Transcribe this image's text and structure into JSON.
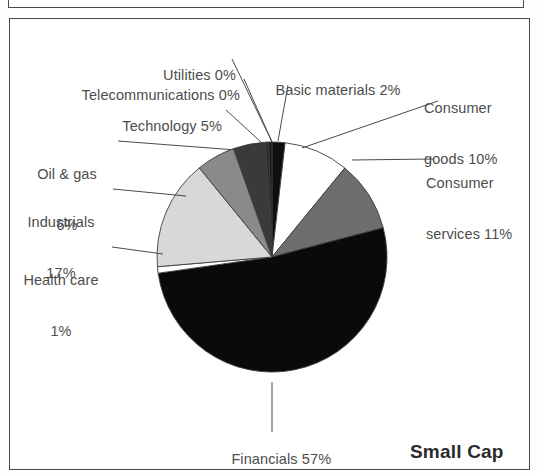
{
  "panel": {
    "title": "Small Cap",
    "border_color": "#4a4a4a",
    "background": "#ffffff"
  },
  "chart_data": {
    "type": "pie",
    "title": "Small Cap",
    "total": 109,
    "units": "percent",
    "legend": "none (direct labels with leader lines)",
    "start_angle_deg": 0,
    "direction": "clockwise",
    "categories": [
      "Basic materials",
      "Consumer goods",
      "Consumer services",
      "Financials",
      "Health care",
      "Industrials",
      "Oil & gas",
      "Technology",
      "Telecommunications",
      "Utilities"
    ],
    "values": [
      2,
      10,
      11,
      57,
      1,
      17,
      6,
      5,
      0,
      0
    ],
    "colors": [
      "#0e0e0e",
      "#ffffff",
      "#6e6e6e",
      "#0a0a0a",
      "#ffffff",
      "#d8d8d8",
      "#8a8a8a",
      "#3a3a3a",
      "#2a2a2a",
      "#1a1a1a"
    ],
    "slices": [
      {
        "label": "Basic materials",
        "value": 2,
        "label_text": "Basic materials 2%",
        "color": "#0e0e0e"
      },
      {
        "label": "Consumer goods",
        "value": 10,
        "label_text": "Consumer goods 10%",
        "color": "#ffffff"
      },
      {
        "label": "Consumer services",
        "value": 11,
        "label_text": "Consumer services 11%",
        "color": "#6e6e6e"
      },
      {
        "label": "Financials",
        "value": 57,
        "label_text": "Financials 57%",
        "color": "#0a0a0a"
      },
      {
        "label": "Health care",
        "value": 1,
        "label_text": "Health care 1%",
        "color": "#ffffff"
      },
      {
        "label": "Industrials",
        "value": 17,
        "label_text": "Industrials 17%",
        "color": "#d8d8d8"
      },
      {
        "label": "Oil & gas",
        "value": 6,
        "label_text": "Oil & gas 6%",
        "color": "#8a8a8a"
      },
      {
        "label": "Technology",
        "value": 5,
        "label_text": "Technology 5%",
        "color": "#3a3a3a"
      },
      {
        "label": "Telecommunications",
        "value": 0,
        "label_text": "Telecommunications 0%",
        "color": "#2a2a2a"
      },
      {
        "label": "Utilities",
        "value": 0,
        "label_text": "Utilities 0%",
        "color": "#1a1a1a"
      }
    ]
  },
  "labels": {
    "utilities": {
      "line1": "Utilities 0%"
    },
    "telecommunications": {
      "line1": "Telecommunications 0%"
    },
    "technology": {
      "line1": "Technology 5%"
    },
    "oil_gas": {
      "line1": "Oil & gas",
      "line2": "6%"
    },
    "industrials": {
      "line1": "Industrials",
      "line2": "17%"
    },
    "health_care": {
      "line1": "Health care",
      "line2": "1%"
    },
    "basic_materials": {
      "line1": "Basic materials 2%"
    },
    "consumer_goods": {
      "line1": "Consumer",
      "line2": "goods 10%"
    },
    "consumer_services": {
      "line1": "Consumer",
      "line2": "services 11%"
    },
    "financials": {
      "line1": "Financials 57%"
    }
  }
}
